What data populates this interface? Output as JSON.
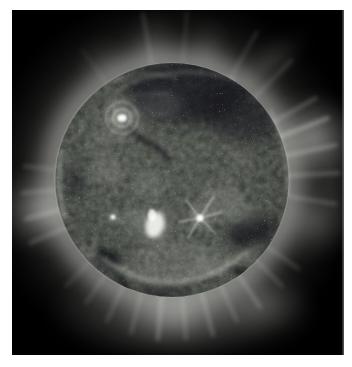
{
  "page": {
    "background_color": "#ffffff"
  },
  "photo": {
    "subject": "sun-extreme-ultraviolet-image",
    "description": "Full-disk extreme-ultraviolet image of the Sun: a mottled gray-green solar disk with bright active regions, dark filament channels and coronal holes, surrounded by glowing white coronal fans and radial streamer plumes against black space, framed by a white page margin",
    "frame_color": "#000000",
    "colors": {
      "space": "#000000",
      "disk_mid": "#3f443e",
      "disk_dark": "#16191b",
      "active_region_bright": "#ffffff",
      "corona_bright": "#e8e9e3",
      "page_margin": "#ffffff"
    }
  }
}
